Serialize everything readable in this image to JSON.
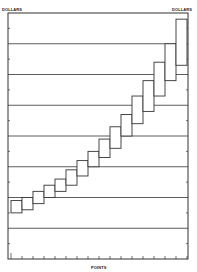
{
  "chart_data": {
    "type": "box",
    "title": "",
    "xlabel": "POINTS",
    "ylabel_left": "DOLLARS",
    "ylabel_right": "DOLLARS",
    "grid": true,
    "x_ticks": 17,
    "boxes": [
      {
        "point": 1,
        "low": 1.5,
        "high": 1.9
      },
      {
        "point": 2,
        "low": 1.6,
        "high": 2.0
      },
      {
        "point": 3,
        "low": 1.8,
        "high": 2.2
      },
      {
        "point": 4,
        "low": 2.0,
        "high": 2.4
      },
      {
        "point": 5,
        "low": 2.2,
        "high": 2.6
      },
      {
        "point": 6,
        "low": 2.4,
        "high": 2.9
      },
      {
        "point": 7,
        "low": 2.7,
        "high": 3.2
      },
      {
        "point": 8,
        "low": 3.0,
        "high": 3.5
      },
      {
        "point": 9,
        "low": 3.3,
        "high": 3.9
      },
      {
        "point": 10,
        "low": 3.6,
        "high": 4.3
      },
      {
        "point": 11,
        "low": 4.0,
        "high": 4.7
      },
      {
        "point": 12,
        "low": 4.4,
        "high": 5.3
      },
      {
        "point": 13,
        "low": 4.8,
        "high": 5.8
      },
      {
        "point": 14,
        "low": 5.3,
        "high": 6.4
      },
      {
        "point": 15,
        "low": 5.8,
        "high": 7.0
      },
      {
        "point": 16,
        "low": 6.3,
        "high": 7.8
      }
    ]
  },
  "labels": {
    "left_axis": "DOLLARS",
    "right_axis": "DOLLARS",
    "bottom_axis": "POINTS"
  }
}
